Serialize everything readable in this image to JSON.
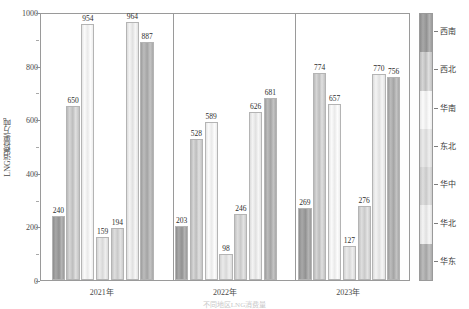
{
  "chart_data": {
    "type": "bar",
    "title": "",
    "xlabel": "",
    "ylabel": "LNG消费量/万吨",
    "categories": [
      "2021年",
      "2022年",
      "2023年"
    ],
    "ylim": [
      0,
      1000
    ],
    "yticks": [
      0,
      200,
      400,
      600,
      800,
      1000
    ],
    "ytick_labels": [
      "0",
      "200",
      "400",
      "600",
      "800",
      "1000"
    ],
    "minor_ticks": [
      100,
      300,
      500,
      700,
      900
    ],
    "grid": false,
    "legend_position": "right",
    "series": [
      {
        "name": "西南",
        "values": [
          240,
          203,
          269
        ]
      },
      {
        "name": "西北",
        "values": [
          650,
          528,
          774
        ]
      },
      {
        "name": "华南",
        "values": [
          954,
          589,
          657
        ]
      },
      {
        "name": "东北",
        "values": [
          159,
          98,
          127
        ]
      },
      {
        "name": "华中",
        "values": [
          194,
          246,
          276
        ]
      },
      {
        "name": "华北",
        "values": [
          964,
          626,
          770
        ]
      },
      {
        "name": "华东",
        "values": [
          887,
          681,
          756
        ]
      }
    ],
    "value_labels": [
      [
        240,
        650,
        954,
        159,
        194,
        964,
        887
      ],
      [
        203,
        528,
        589,
        98,
        246,
        626,
        681
      ],
      [
        269,
        774,
        657,
        127,
        276,
        770,
        756
      ]
    ]
  },
  "legend": {
    "entries": [
      "西南",
      "西北",
      "华南",
      "东北",
      "华中",
      "华北",
      "华东"
    ]
  },
  "caption": "不同地区LNG消费量"
}
